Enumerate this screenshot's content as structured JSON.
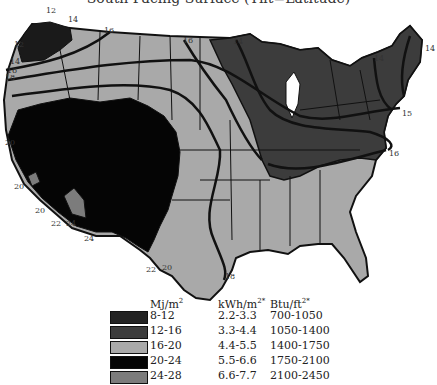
{
  "title": "South Facing Surface (Tilt=Latitude)",
  "colors": {
    "8-12": "#232323",
    "12-16": "#3c3c3c",
    "16-20": "#a9a9a9",
    "20-24": "#050505",
    "24-28": "#7c7c7c",
    "lakes": "#ffffff",
    "borders": "#111111"
  },
  "contour_labels": [
    {
      "text": "12",
      "x": 46,
      "y": 6
    },
    {
      "text": "14",
      "x": 68,
      "y": 15
    },
    {
      "text": "16",
      "x": 104,
      "y": 26
    },
    {
      "text": "12",
      "x": 14,
      "y": 40
    },
    {
      "text": "14",
      "x": 10,
      "y": 57
    },
    {
      "text": "16",
      "x": 7,
      "y": 66
    },
    {
      "text": "18",
      "x": 5,
      "y": 73
    },
    {
      "text": "16",
      "x": 183,
      "y": 36
    },
    {
      "text": "14",
      "x": 233,
      "y": 37
    },
    {
      "text": "14",
      "x": 374,
      "y": 54
    },
    {
      "text": "14",
      "x": 425,
      "y": 44
    },
    {
      "text": "15",
      "x": 402,
      "y": 109
    },
    {
      "text": "16",
      "x": 389,
      "y": 149
    },
    {
      "text": "20",
      "x": 5,
      "y": 138
    },
    {
      "text": "20",
      "x": 14,
      "y": 182
    },
    {
      "text": "20",
      "x": 35,
      "y": 206
    },
    {
      "text": "22",
      "x": 51,
      "y": 219
    },
    {
      "text": "24",
      "x": 66,
      "y": 219
    },
    {
      "text": "24",
      "x": 84,
      "y": 234
    },
    {
      "text": "22",
      "x": 146,
      "y": 265
    },
    {
      "text": "20",
      "x": 162,
      "y": 263
    },
    {
      "text": "18",
      "x": 225,
      "y": 272
    }
  ],
  "legend": {
    "headers": [
      "Mj/m",
      "kWh/m",
      "Btu/ft"
    ],
    "header_sup": [
      "2",
      "2*",
      "2*"
    ],
    "rows": [
      {
        "mj": "8-12",
        "kwh": "2.2-3.3",
        "btu": "700-1050",
        "color_key": "8-12"
      },
      {
        "mj": "12-16",
        "kwh": "3.3-4.4",
        "btu": "1050-1400",
        "color_key": "12-16"
      },
      {
        "mj": "16-20",
        "kwh": "4.4-5.5",
        "btu": "1400-1750",
        "color_key": "16-20"
      },
      {
        "mj": "20-24",
        "kwh": "5.5-6.6",
        "btu": "1750-2100",
        "color_key": "20-24"
      },
      {
        "mj": "24-28",
        "kwh": "6.6-7.7",
        "btu": "2100-2450",
        "color_key": "24-28"
      }
    ]
  }
}
